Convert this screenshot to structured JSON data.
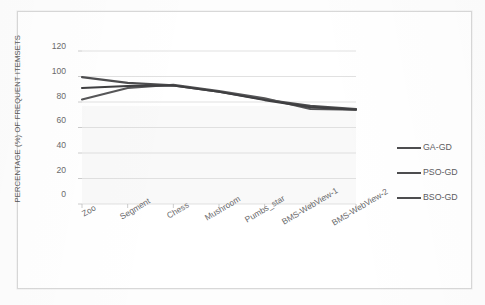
{
  "chart_data": {
    "type": "line",
    "title": "",
    "xlabel": "",
    "ylabel": "PERCENTAGE (%) OF FREQUENT ITEMSETS",
    "categories": [
      "Zoo",
      "Segment",
      "Chess",
      "Mushroom",
      "Pumbs_star",
      "BMS-WebView-1",
      "BMS-WebView-2"
    ],
    "series": [
      {
        "name": "GA-GD",
        "color": "#4d4d4f",
        "values": [
          99.5,
          95.0,
          93.0,
          88.0,
          82.0,
          77.0,
          74.5
        ]
      },
      {
        "name": "PSO-GD",
        "color": "#565658",
        "values": [
          82.0,
          91.0,
          93.5,
          88.5,
          83.0,
          74.5,
          74.0
        ]
      },
      {
        "name": "BSO-GD",
        "color": "#3f3f41",
        "values": [
          91.0,
          92.5,
          93.0,
          88.0,
          81.5,
          76.0,
          74.0
        ]
      }
    ],
    "ylim": [
      0,
      120
    ],
    "yticks": [
      0,
      20,
      40,
      60,
      80,
      100,
      120
    ],
    "grid": true,
    "legend_position": "right",
    "gridline_color": "#d9d9d9",
    "axis_color": "#bfbfbf",
    "background": "#ffffff"
  },
  "ticks": {
    "y0": "0",
    "y20": "20",
    "y40": "40",
    "y60": "60",
    "y80": "80",
    "y100": "100",
    "y120": "120"
  },
  "categories": {
    "c0": "Zoo",
    "c1": "Segment",
    "c2": "Chess",
    "c3": "Mushroom",
    "c4": "Pumbs_star",
    "c5": "BMS-WebView-1",
    "c6": "BMS-WebView-2"
  },
  "legend": {
    "s0": "GA-GD",
    "s1": "PSO-GD",
    "s2": "BSO-GD"
  }
}
